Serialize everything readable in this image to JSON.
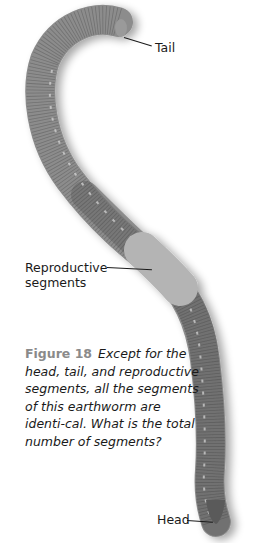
{
  "figure": {
    "labels": {
      "tail": "Tail",
      "reproductive_line1": "Reproductive",
      "reproductive_line2": "segments",
      "head": "Head"
    },
    "caption": {
      "number": "Figure 18",
      "text": "Except for the head, tail, and reproductive segments, all the segments of this earthworm are identi-cal. What is the total number of segments?"
    },
    "colors": {
      "background": "#ffffff",
      "worm_body": "#8c8c8c",
      "worm_dark": "#5e5e5e",
      "clitellum": "#b4b4b4",
      "figure_number": "#8a8a8a",
      "text": "#1a1a1a"
    }
  }
}
